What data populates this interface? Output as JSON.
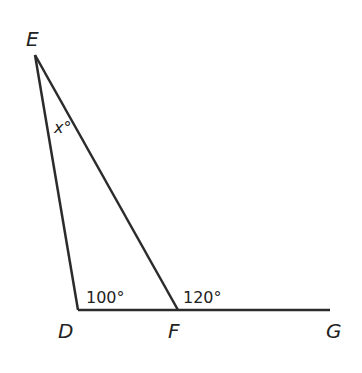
{
  "diagram": {
    "type": "geometry-triangle",
    "line_color": "#2b2b2b",
    "vertices": {
      "E": {
        "label": "E",
        "x": 35,
        "y": 55
      },
      "D": {
        "label": "D",
        "x": 78,
        "y": 310
      },
      "F": {
        "label": "F",
        "x": 178,
        "y": 310
      },
      "G": {
        "label": "G",
        "x": 330,
        "y": 310
      }
    },
    "segments": [
      {
        "from": "E",
        "to": "D"
      },
      {
        "from": "E",
        "to": "F"
      },
      {
        "from": "D",
        "to": "G"
      }
    ],
    "angles": {
      "x": {
        "label": "x°",
        "at": "E"
      },
      "D": {
        "label": "100°",
        "at": "D"
      },
      "F_ext": {
        "label": "120°",
        "at": "F"
      }
    }
  }
}
